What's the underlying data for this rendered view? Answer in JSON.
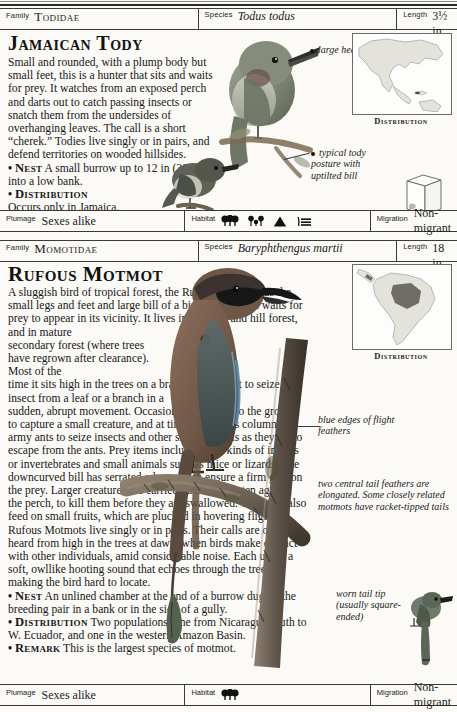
{
  "page": {
    "background_color": "#fbfaf6",
    "ink_color": "#1b1b1b"
  },
  "entries": [
    {
      "id": "jamaican-tody",
      "header": {
        "family_key": "Family",
        "family_value": "Todidae",
        "species_key": "Species",
        "species_value": "Todus todus",
        "length_key": "Length",
        "length_value": "3½ in (9 cm)"
      },
      "title": "Jamaican Tody",
      "body": {
        "intro": "Small and rounded, with a plump body but small feet, this is a hunter that sits and waits for prey. It watches from an exposed perch and darts out to catch passing insects or snatch them from the undersides of overhanging leaves. The call is a short “cherek.” Todies live singly or in pairs, and defend territories on wooded hillsides.",
        "nest_label": "Nest",
        "nest_text": "A small burrow up to 12 in (30 cm) into a low bank.",
        "distribution_label": "Distribution",
        "distribution_text": "Occurs only in Jamaica.",
        "bullet": "•"
      },
      "captions": [
        {
          "id": "large-head",
          "text": "large head"
        },
        {
          "id": "tody-posture",
          "text": "typical tody posture with uptilted bill"
        }
      ],
      "juvenile_label": "Juvenile",
      "distribution_map": {
        "label": "Distribution",
        "region": "Caribbean — Jamaica",
        "continent": "North America and Caribbean"
      },
      "footer": {
        "plumage_key": "Plumage",
        "plumage_value": "Sexes alike",
        "habitat_key": "Habitat",
        "habitat_icons": [
          "dense-trees-icon",
          "open-woodland-icon",
          "mountain-icon",
          "reeds-icon"
        ],
        "migration_key": "Migration",
        "migration_value": "Non-migrant"
      }
    },
    {
      "id": "rufous-motmot",
      "header": {
        "family_key": "Family",
        "family_value": "Momotidae",
        "species_key": "Species",
        "species_value": "Baryphthengus martii",
        "length_key": "Length",
        "length_value": "18 in (46 cm)"
      },
      "title": "Rufous Motmot",
      "body": {
        "intro_a": "A sluggish bird of tropical forest, the Rufous Motmot has the small legs and feet and large bill of a bird that sits and waits for prey to appear in its vicinity. It lives in lowland and hill forest, and in mature",
        "intro_narrow": "secondary forest (where trees have regrown after clearance). Most of the",
        "intro_b": "time it sits high in the trees on a branch, flying out to seize an insect from a leaf or a branch in a",
        "intro_c": "sudden, abrupt movement. Occasionally it drops to the ground to capture a small creature, and at times it follows columns of army ants to seize insects and other small animals as they try to escape from the ants. Prey items include many kinds of insects or invertebrates and small animals such as mice or lizards. The downcurved bill has serrated edges which ensure a firm grip on the prey. Larger creatures are carried back and beaten against the perch, to kill them before they are swallowed. The birds also feed on small fruits, which are plucked in hovering flight. Rufous Motmots live singly or in pairs. Their calls are often heard from high in the trees at dawn, when birds make contact with other individuals, amid considerable noise. Each utters a soft, owllike hooting sound that echoes through the trees, making the bird hard to locate.",
        "nest_label": "Nest",
        "nest_text": "An unlined chamber at the end of a burrow dug by the breeding pair in a bank or in the side of a gully.",
        "distribution_label": "Distribution",
        "distribution_text": "Two populations: one from Nicaragua south to W. Ecuador, and one in the western Amazon Basin.",
        "remark_label": "Remark",
        "remark_text": "This is the largest species of motmot.",
        "bullet": "•"
      },
      "captions": [
        {
          "id": "flight-feathers",
          "text": "blue edges of flight feathers"
        },
        {
          "id": "tail-feathers",
          "text": "two central tail feathers are elongated. Some closely related motmots have racket-tipped tails"
        },
        {
          "id": "tail-tip",
          "text": "worn tail tip (usually square-ended)"
        }
      ],
      "distribution_map": {
        "label": "Distribution",
        "region": "Amazon Basin and Central America",
        "continent": "South America"
      },
      "footer": {
        "plumage_key": "Plumage",
        "plumage_value": "Sexes alike",
        "habitat_key": "Habitat",
        "habitat_icons": [
          "dense-trees-icon"
        ],
        "migration_key": "Migration",
        "migration_value": "Non-migrant"
      }
    }
  ]
}
